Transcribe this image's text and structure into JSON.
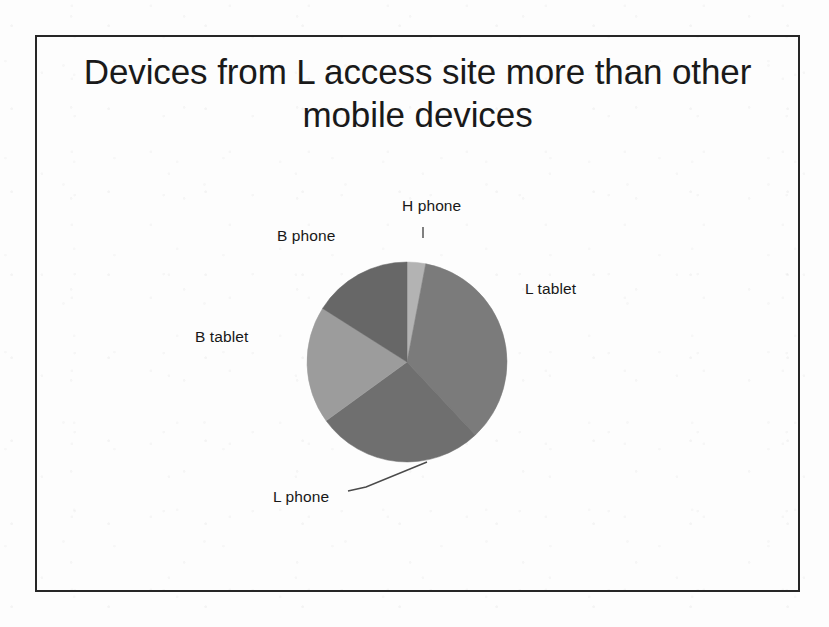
{
  "slide": {
    "title": "Devices from L access site more than other mobile devices",
    "background_color": "#fdfdfd",
    "frame_color": "#262626"
  },
  "chart_data": {
    "type": "pie",
    "title": "Devices from L access site more than other mobile devices",
    "categories": [
      "H phone",
      "L tablet",
      "L phone",
      "B tablet",
      "B phone"
    ],
    "values": [
      3,
      35,
      27,
      19,
      16
    ],
    "labels": [
      "H phone",
      "L tablet",
      "L phone",
      "B tablet",
      "B phone"
    ],
    "colors": [
      "#b3b3b3",
      "#7b7b7b",
      "#6f6f6f",
      "#9c9c9c",
      "#676767"
    ],
    "legend": "none",
    "label_position": "outside",
    "start_angle_deg": 0,
    "direction": "clockwise",
    "grid": false,
    "xlabel": "",
    "ylabel": ""
  },
  "labels": {
    "h_phone": "H phone",
    "l_tablet": "L tablet",
    "l_phone": "L phone",
    "b_tablet": "B tablet",
    "b_phone": "B phone"
  }
}
